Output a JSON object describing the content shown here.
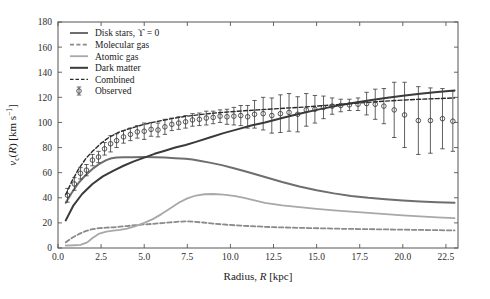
{
  "chart_data": {
    "type": "line",
    "title": "",
    "xlabel": "Radius, R [kpc]",
    "xlabel_parts": {
      "prefix": "Radius, ",
      "italic": "R",
      "suffix": " [kpc]"
    },
    "ylabel": "v_c(R) [km s^-1]",
    "ylabel_parts": {
      "v": "v",
      "sub": "c",
      "paren_open": "(",
      "italic": "R",
      "paren_close": ")",
      "unit": " [km s",
      "exp": "−1",
      "unit_close": "]"
    },
    "xlim": [
      0,
      23.2
    ],
    "ylim": [
      0,
      180
    ],
    "xticks": [
      0.0,
      2.5,
      5.0,
      7.5,
      10.0,
      12.5,
      15.0,
      17.5,
      20.0,
      22.5
    ],
    "xtick_labels": [
      "0.0",
      "2.5",
      "5.0",
      "7.5",
      "10.0",
      "12.5",
      "15.0",
      "17.5",
      "20.0",
      "22.5"
    ],
    "yticks": [
      0,
      20,
      40,
      60,
      80,
      100,
      120,
      140,
      160,
      180
    ],
    "ytick_labels": [
      "0",
      "20",
      "40",
      "60",
      "80",
      "100",
      "120",
      "140",
      "160",
      "180"
    ],
    "grid": false,
    "legend_position": "upper left",
    "colors": {
      "disk_stars": "#6e6e6e",
      "molecular_gas": "#8a8a8a",
      "atomic_gas": "#a8a8a8",
      "dark_matter": "#3a3a3a",
      "combined": "#2a2a2a",
      "observed": "#3a3a3a",
      "frame": "#555555"
    },
    "legend": [
      {
        "label": "Disk stars, ϒ = 0",
        "style": "solid",
        "color": "#6e6e6e",
        "width": 2.0,
        "key": "disk_stars"
      },
      {
        "label": "Molecular gas",
        "style": "dashed",
        "color": "#8a8a8a",
        "width": 1.8,
        "key": "molecular_gas"
      },
      {
        "label": "Atomic gas",
        "style": "solid",
        "color": "#a8a8a8",
        "width": 1.8,
        "key": "atomic_gas"
      },
      {
        "label": "Dark matter",
        "style": "solid",
        "color": "#3a3a3a",
        "width": 2.0,
        "key": "dark_matter"
      },
      {
        "label": "Combined",
        "style": "dashed",
        "color": "#2a2a2a",
        "width": 1.4,
        "key": "combined"
      },
      {
        "label": "Observed",
        "style": "marker",
        "color": "#3a3a3a",
        "width": 1.0,
        "key": "observed"
      }
    ],
    "series": [
      {
        "name": "Disk stars, ϒ = 0",
        "key": "disk_stars",
        "style": "solid",
        "color": "#6e6e6e",
        "width": 2.0,
        "x": [
          0.45,
          0.8,
          1.2,
          1.6,
          2.0,
          2.4,
          2.8,
          3.1,
          3.4,
          3.8,
          4.3,
          5.0,
          5.6,
          6.2,
          6.8,
          7.4,
          7.8,
          8.2,
          8.8,
          9.5,
          10.2,
          11.0,
          12.0,
          13.0,
          14.0,
          15.0,
          16.0,
          17.0,
          18.0,
          19.0,
          20.0,
          21.0,
          22.0,
          23.0
        ],
        "y": [
          36.0,
          44.0,
          52.0,
          58.0,
          63.0,
          67.0,
          70.0,
          71.5,
          72.0,
          72.2,
          72.3,
          72.4,
          72.3,
          72.0,
          71.5,
          71.0,
          70.5,
          69.5,
          68.0,
          66.0,
          63.5,
          60.5,
          56.5,
          52.5,
          49.0,
          46.0,
          43.5,
          41.5,
          40.0,
          38.8,
          37.8,
          37.0,
          36.4,
          36.0
        ]
      },
      {
        "name": "Molecular gas",
        "key": "molecular_gas",
        "style": "dashed",
        "color": "#8a8a8a",
        "width": 1.8,
        "x": [
          0.45,
          0.8,
          1.2,
          1.6,
          2.0,
          2.4,
          2.8,
          3.2,
          3.6,
          4.0,
          4.5,
          5.0,
          5.5,
          6.0,
          6.5,
          7.0,
          7.4,
          7.8,
          8.4,
          9.0,
          9.8,
          10.6,
          11.5,
          12.5,
          13.5,
          14.5,
          15.5,
          16.5,
          17.5,
          18.5,
          19.5,
          20.5,
          21.5,
          22.5,
          23.0
        ],
        "y": [
          4.5,
          8.0,
          11.0,
          13.5,
          15.0,
          15.8,
          16.2,
          16.5,
          17.0,
          17.5,
          18.2,
          18.8,
          19.2,
          19.8,
          20.4,
          21.0,
          21.2,
          21.0,
          20.3,
          19.4,
          18.5,
          17.8,
          17.2,
          16.6,
          16.2,
          15.9,
          15.6,
          15.3,
          15.1,
          14.9,
          14.7,
          14.5,
          14.3,
          14.1,
          14.0
        ]
      },
      {
        "name": "Atomic gas",
        "key": "atomic_gas",
        "style": "solid",
        "color": "#a8a8a8",
        "width": 1.8,
        "x": [
          0.45,
          0.9,
          1.3,
          1.7,
          2.0,
          2.4,
          2.8,
          3.2,
          3.6,
          4.0,
          4.5,
          5.0,
          5.5,
          6.0,
          6.5,
          7.0,
          7.5,
          8.0,
          8.5,
          9.0,
          9.6,
          10.2,
          10.8,
          11.4,
          12.0,
          13.0,
          14.0,
          15.0,
          16.0,
          17.0,
          18.0,
          19.0,
          20.0,
          21.0,
          22.0,
          23.0
        ],
        "y": [
          2.0,
          2.2,
          2.5,
          4.5,
          8.0,
          11.5,
          13.0,
          13.8,
          14.5,
          15.5,
          17.5,
          20.0,
          23.0,
          27.0,
          31.5,
          36.0,
          39.5,
          41.8,
          42.8,
          43.0,
          42.5,
          41.5,
          40.0,
          38.0,
          36.0,
          34.0,
          32.5,
          31.2,
          30.0,
          29.0,
          28.0,
          27.0,
          26.0,
          25.2,
          24.4,
          23.8
        ]
      },
      {
        "name": "Dark matter",
        "key": "dark_matter",
        "style": "solid",
        "color": "#3a3a3a",
        "width": 2.0,
        "x": [
          0.45,
          0.9,
          1.4,
          2.0,
          2.6,
          3.2,
          3.8,
          4.4,
          5.0,
          5.6,
          6.2,
          6.8,
          7.4,
          8.0,
          8.8,
          9.6,
          10.4,
          11.2,
          12.0,
          13.0,
          14.0,
          15.0,
          16.0,
          17.0,
          18.0,
          19.0,
          20.0,
          21.0,
          22.0,
          23.0
        ],
        "y": [
          22.0,
          34.0,
          43.0,
          51.0,
          57.0,
          61.5,
          65.5,
          69.0,
          72.0,
          75.0,
          77.5,
          80.0,
          82.0,
          84.5,
          88.0,
          91.5,
          94.5,
          97.5,
          100.0,
          103.5,
          107.0,
          110.0,
          112.8,
          115.2,
          117.5,
          119.5,
          121.2,
          122.8,
          124.2,
          125.5
        ]
      },
      {
        "name": "Combined",
        "key": "combined",
        "style": "dashed",
        "color": "#2a2a2a",
        "width": 1.4,
        "x": [
          0.45,
          0.8,
          1.2,
          1.6,
          2.0,
          2.5,
          3.0,
          3.5,
          4.0,
          4.5,
          5.0,
          5.5,
          6.0,
          6.5,
          7.0,
          7.5,
          8.0,
          8.6,
          9.2,
          10.0,
          10.8,
          11.6,
          12.4,
          13.2,
          14.0,
          15.0,
          16.0,
          17.0,
          18.0,
          19.0,
          20.0,
          21.0,
          22.0,
          23.0
        ],
        "y": [
          42.5,
          53.0,
          63.0,
          71.0,
          77.0,
          83.5,
          88.5,
          92.0,
          94.5,
          96.5,
          98.5,
          100.0,
          101.5,
          102.8,
          104.0,
          105.0,
          105.8,
          106.8,
          107.6,
          108.5,
          109.3,
          110.0,
          110.7,
          111.4,
          112.0,
          113.0,
          114.0,
          115.0,
          116.0,
          117.0,
          117.8,
          118.5,
          119.0,
          119.5
        ]
      }
    ],
    "observed": {
      "name": "Observed",
      "color": "#3a3a3a",
      "marker": "open-circle",
      "points": [
        {
          "x": 0.55,
          "y": 42.0,
          "err": 5.5
        },
        {
          "x": 0.95,
          "y": 51.0,
          "err": 5.0
        },
        {
          "x": 1.3,
          "y": 59.5,
          "err": 4.5
        },
        {
          "x": 1.65,
          "y": 62.0,
          "err": 4.5
        },
        {
          "x": 2.0,
          "y": 70.0,
          "err": 4.5
        },
        {
          "x": 2.35,
          "y": 72.5,
          "err": 4.5
        },
        {
          "x": 2.7,
          "y": 79.0,
          "err": 5.0
        },
        {
          "x": 3.05,
          "y": 83.0,
          "err": 6.5
        },
        {
          "x": 3.4,
          "y": 85.5,
          "err": 5.5
        },
        {
          "x": 3.8,
          "y": 88.5,
          "err": 5.0
        },
        {
          "x": 4.2,
          "y": 90.5,
          "err": 5.0
        },
        {
          "x": 4.6,
          "y": 92.5,
          "err": 5.0
        },
        {
          "x": 5.0,
          "y": 93.0,
          "err": 6.5
        },
        {
          "x": 5.4,
          "y": 94.5,
          "err": 5.5
        },
        {
          "x": 5.8,
          "y": 94.0,
          "err": 5.5
        },
        {
          "x": 6.2,
          "y": 96.5,
          "err": 6.0
        },
        {
          "x": 6.6,
          "y": 98.5,
          "err": 5.0
        },
        {
          "x": 7.0,
          "y": 99.5,
          "err": 5.0
        },
        {
          "x": 7.4,
          "y": 100.5,
          "err": 5.0
        },
        {
          "x": 7.8,
          "y": 102.0,
          "err": 5.0
        },
        {
          "x": 8.2,
          "y": 102.5,
          "err": 5.0
        },
        {
          "x": 8.6,
          "y": 103.5,
          "err": 5.5
        },
        {
          "x": 9.0,
          "y": 104.0,
          "err": 5.0
        },
        {
          "x": 9.4,
          "y": 105.0,
          "err": 5.0
        },
        {
          "x": 9.8,
          "y": 104.5,
          "err": 6.0
        },
        {
          "x": 10.2,
          "y": 105.0,
          "err": 7.0
        },
        {
          "x": 10.6,
          "y": 105.5,
          "err": 8.0
        },
        {
          "x": 11.0,
          "y": 104.5,
          "err": 9.0
        },
        {
          "x": 11.4,
          "y": 106.5,
          "err": 11.0
        },
        {
          "x": 11.9,
          "y": 107.0,
          "err": 13.0
        },
        {
          "x": 12.4,
          "y": 105.5,
          "err": 14.0
        },
        {
          "x": 12.9,
          "y": 107.0,
          "err": 15.0
        },
        {
          "x": 13.4,
          "y": 108.0,
          "err": 15.0
        },
        {
          "x": 13.9,
          "y": 106.5,
          "err": 14.0
        },
        {
          "x": 14.4,
          "y": 110.0,
          "err": 13.0
        },
        {
          "x": 14.9,
          "y": 110.5,
          "err": 11.0
        },
        {
          "x": 15.4,
          "y": 112.0,
          "err": 9.0
        },
        {
          "x": 15.9,
          "y": 113.0,
          "err": 6.5
        },
        {
          "x": 16.4,
          "y": 113.5,
          "err": 5.0
        },
        {
          "x": 16.9,
          "y": 114.0,
          "err": 4.5
        },
        {
          "x": 17.4,
          "y": 114.5,
          "err": 5.0
        },
        {
          "x": 17.9,
          "y": 115.0,
          "err": 9.0
        },
        {
          "x": 18.4,
          "y": 114.5,
          "err": 12.0
        },
        {
          "x": 18.9,
          "y": 113.0,
          "err": 14.0
        },
        {
          "x": 19.5,
          "y": 110.0,
          "err": 22.0
        },
        {
          "x": 20.1,
          "y": 106.0,
          "err": 26.0
        },
        {
          "x": 20.9,
          "y": 101.5,
          "err": 27.0
        },
        {
          "x": 21.6,
          "y": 101.5,
          "err": 26.0
        },
        {
          "x": 22.3,
          "y": 103.0,
          "err": 24.0
        },
        {
          "x": 22.9,
          "y": 101.0,
          "err": 24.0
        }
      ]
    }
  }
}
